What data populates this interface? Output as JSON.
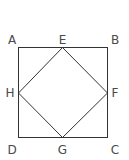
{
  "diagram": {
    "type": "geometry-figure",
    "line_color": "#333333",
    "label_color": "#4a4a4a",
    "points": {
      "A": {
        "label": "A"
      },
      "B": {
        "label": "B"
      },
      "C": {
        "label": "C"
      },
      "D": {
        "label": "D"
      },
      "E": {
        "label": "E"
      },
      "F": {
        "label": "F"
      },
      "G": {
        "label": "G"
      },
      "H": {
        "label": "H"
      }
    },
    "outer_square": [
      "A",
      "B",
      "C",
      "D"
    ],
    "inner_square": [
      "E",
      "F",
      "G",
      "H"
    ]
  }
}
